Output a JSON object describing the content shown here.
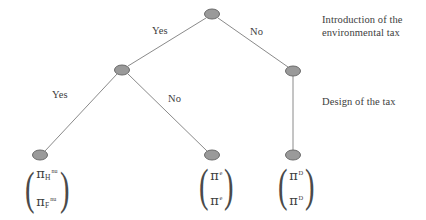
{
  "figure": {
    "type": "game-theory-decision-tree",
    "background_color": "#ffffff",
    "node_fill": "#9a9a9a",
    "node_stroke": "#6b6b6b",
    "edge_color": "#8a8a8a",
    "text_color": "#3d3d3d"
  },
  "nodes": [
    {
      "id": "root",
      "x": 212,
      "y": 14,
      "rx": 7.5,
      "ry": 5
    },
    {
      "id": "left-internal",
      "x": 122,
      "y": 70,
      "rx": 7.5,
      "ry": 5
    },
    {
      "id": "right-internal",
      "x": 293,
      "y": 71,
      "rx": 7.5,
      "ry": 5
    },
    {
      "id": "leaf-left",
      "x": 40,
      "y": 155,
      "rx": 7.5,
      "ry": 5
    },
    {
      "id": "leaf-middle",
      "x": 212,
      "y": 155,
      "rx": 7.5,
      "ry": 5
    },
    {
      "id": "leaf-right",
      "x": 293,
      "y": 155,
      "rx": 7.5,
      "ry": 5
    }
  ],
  "edges": [
    {
      "id": "root-to-left",
      "from": "root",
      "to": "left-internal",
      "label": "Yes"
    },
    {
      "id": "root-to-right",
      "from": "root",
      "to": "right-internal",
      "label": "No"
    },
    {
      "id": "left-to-leafleft",
      "from": "left-internal",
      "to": "leaf-left",
      "label": "Yes"
    },
    {
      "id": "left-to-leafmiddle",
      "from": "left-internal",
      "to": "leaf-middle",
      "label": "No"
    },
    {
      "id": "right-to-leafright",
      "from": "right-internal",
      "to": "leaf-right",
      "label": ""
    }
  ],
  "edge_labels": {
    "root_yes": "Yes",
    "root_no": "No",
    "second_yes": "Yes",
    "second_no": "No"
  },
  "stage_labels": {
    "stage1": "Introduction of the\nenvironmental tax",
    "stage2": "Design of the tax"
  },
  "payoffs": {
    "left": {
      "row1": {
        "symbol": "π",
        "subscript": "H",
        "superscript": "nu"
      },
      "row2": {
        "symbol": "π",
        "subscript": "F",
        "superscript": "nu"
      }
    },
    "middle": {
      "row1": {
        "symbol": "π",
        "subscript": "",
        "superscript": "e"
      },
      "row2": {
        "symbol": "π",
        "subscript": "",
        "superscript": "e"
      }
    },
    "right": {
      "row1": {
        "symbol": "π",
        "subscript": "",
        "superscript": "D"
      },
      "row2": {
        "symbol": "π",
        "subscript": "",
        "superscript": "D"
      }
    }
  },
  "parens": {
    "open": "(",
    "close": ")"
  }
}
